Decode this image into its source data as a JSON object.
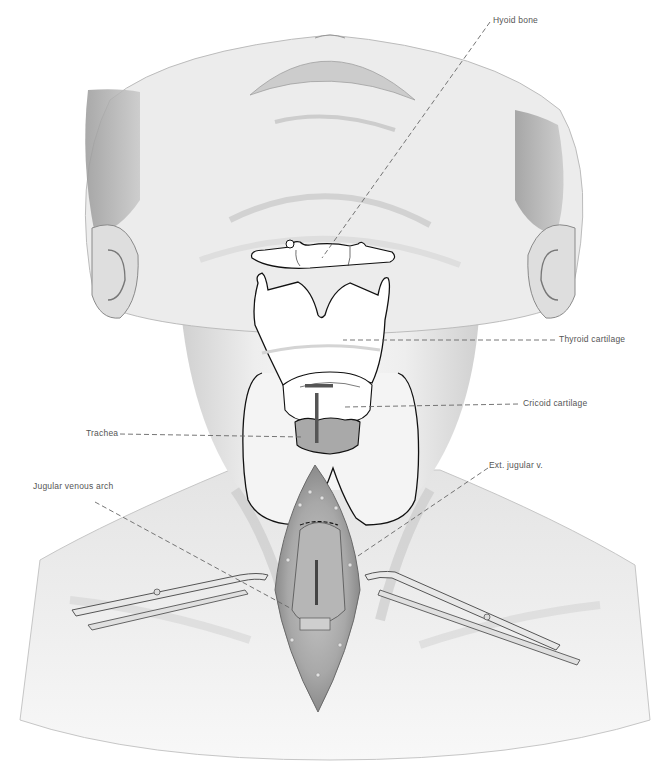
{
  "figure": {
    "colors": {
      "skin_light": "#f2f2f2",
      "skin_mid": "#dcdcdc",
      "skin_shadow": "#b8b8b8",
      "outline": "#111111",
      "leader": "#666666",
      "trachea_fill": "#a9a9a9",
      "label_text": "#555555"
    }
  },
  "labels": [
    {
      "id": "hyoid",
      "text": "Hyoid bone"
    },
    {
      "id": "thyroid",
      "text": "Thyroid cartilage"
    },
    {
      "id": "cricoid",
      "text": "Cricoid cartilage"
    },
    {
      "id": "trachea",
      "text": "Trachea"
    },
    {
      "id": "jugular_arch",
      "text": "Jugular venous arch"
    },
    {
      "id": "ext_jugular",
      "text": "Ext. jugular v."
    }
  ]
}
